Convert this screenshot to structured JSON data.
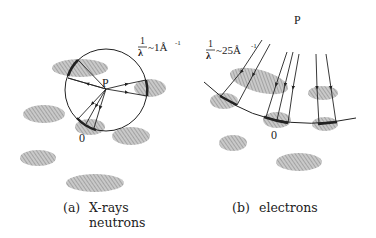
{
  "panel_a": {
    "point_P": "P",
    "point_O": "0",
    "wavevector_label": "1/λ ~ 1Å⁻¹",
    "frac_num": "1",
    "frac_den": "λ",
    "approx_value": "~1Å",
    "exponent": "-1",
    "caption_tag": "(a)",
    "caption_line1": "X-rays",
    "caption_line2": "neutrons"
  },
  "panel_b": {
    "point_P": "P",
    "point_O": "0",
    "wavevector_label": "1/λ ~ 25Å⁻¹",
    "frac_num": "1",
    "frac_den": "λ",
    "approx_value": "~25Å",
    "exponent": "-1",
    "caption_tag": "(b)",
    "caption_line1": "electrons"
  },
  "colors": {
    "line": "#222222",
    "blob": "#9a9a9a"
  }
}
